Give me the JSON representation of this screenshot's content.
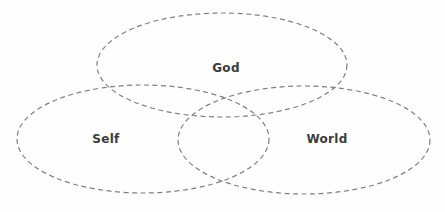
{
  "diagram": {
    "type": "venn",
    "title": "",
    "background_color": "#fefefe",
    "stroke_color": "#808080",
    "label_color": "#3c3c3c",
    "stroke_dash": "5 3.5",
    "stroke_width": 1.2,
    "sets": [
      {
        "id": "god",
        "label": "God",
        "label_x": 226,
        "label_y": 68,
        "cx": 222,
        "cy": 65,
        "rx": 125,
        "ry": 52
      },
      {
        "id": "self",
        "label": "Self",
        "label_x": 106,
        "label_y": 139,
        "cx": 143,
        "cy": 139,
        "rx": 126,
        "ry": 54
      },
      {
        "id": "world",
        "label": "World",
        "label_x": 327,
        "label_y": 139,
        "cx": 304,
        "cy": 140,
        "rx": 126,
        "ry": 54
      }
    ]
  }
}
